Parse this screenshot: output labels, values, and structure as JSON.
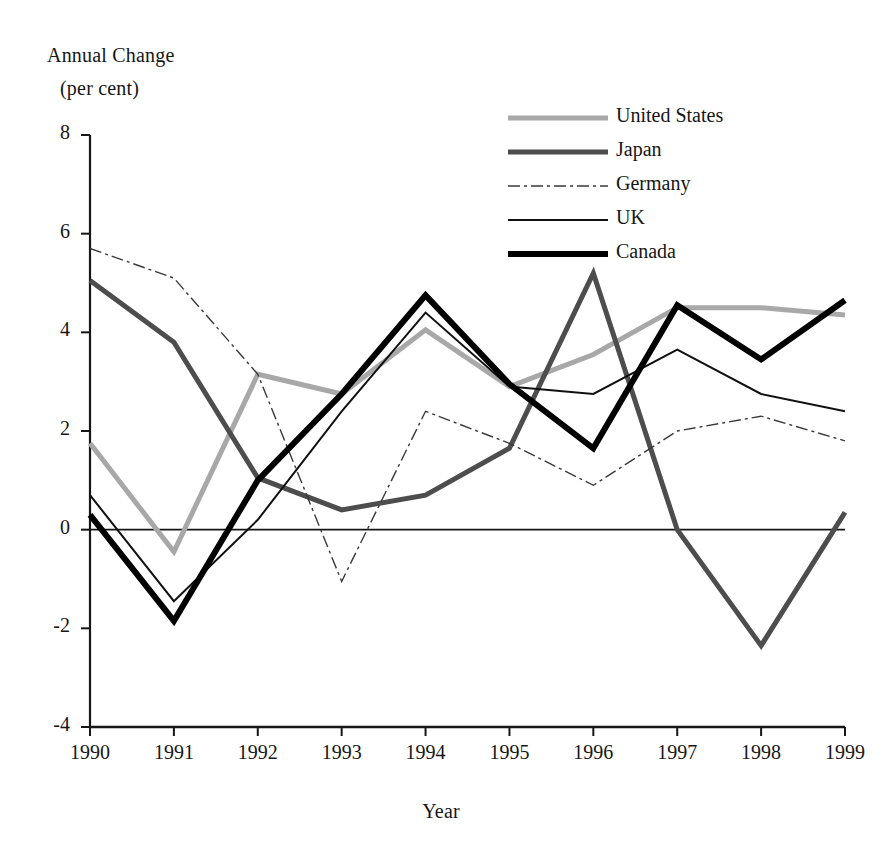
{
  "chart_data": {
    "type": "line",
    "title": "",
    "ylabel_line1": "Annual Change",
    "ylabel_line2": "(per cent)",
    "xlabel": "Year",
    "categories": [
      "1990",
      "1991",
      "1992",
      "1993",
      "1994",
      "1995",
      "1996",
      "1997",
      "1998",
      "1999"
    ],
    "x": [
      1990,
      1991,
      1992,
      1993,
      1994,
      1995,
      1996,
      1997,
      1998,
      1999
    ],
    "ylim": [
      -4,
      8
    ],
    "yticks": [
      "8",
      "6",
      "4",
      "2",
      "0",
      "-2",
      "-4"
    ],
    "ytick_values": [
      8,
      6,
      4,
      2,
      0,
      -2,
      -4
    ],
    "grid": false,
    "legend_position": "top-right",
    "zero_line": true,
    "series": [
      {
        "name": "United States",
        "values": [
          1.75,
          -0.45,
          3.15,
          2.75,
          4.05,
          2.9,
          3.55,
          4.5,
          4.5,
          4.35
        ],
        "color": "#a8a8a8",
        "width": 5,
        "dash": ""
      },
      {
        "name": "Japan",
        "values": [
          5.05,
          3.8,
          1.05,
          0.4,
          0.7,
          1.65,
          5.2,
          0.0,
          -2.35,
          0.35
        ],
        "color": "#4d4d4d",
        "width": 5,
        "dash": ""
      },
      {
        "name": "Germany",
        "values": [
          5.7,
          5.1,
          3.15,
          -1.05,
          2.4,
          1.75,
          0.9,
          2.0,
          2.3,
          1.8
        ],
        "color": "#3a3a3a",
        "width": 1.4,
        "dash": "12,4,3,4"
      },
      {
        "name": "UK",
        "values": [
          0.7,
          -1.45,
          0.2,
          2.4,
          4.4,
          2.9,
          2.75,
          3.65,
          2.75,
          2.4
        ],
        "color": "#111111",
        "width": 2,
        "dash": ""
      },
      {
        "name": "Canada",
        "values": [
          0.3,
          -1.85,
          1.0,
          2.75,
          4.75,
          2.95,
          1.65,
          4.55,
          3.45,
          4.65
        ],
        "color": "#000000",
        "width": 6,
        "dash": ""
      }
    ]
  },
  "legend": {
    "entries": [
      {
        "label": "United States"
      },
      {
        "label": "Japan"
      },
      {
        "label": "Germany"
      },
      {
        "label": "UK"
      },
      {
        "label": "Canada"
      }
    ]
  }
}
